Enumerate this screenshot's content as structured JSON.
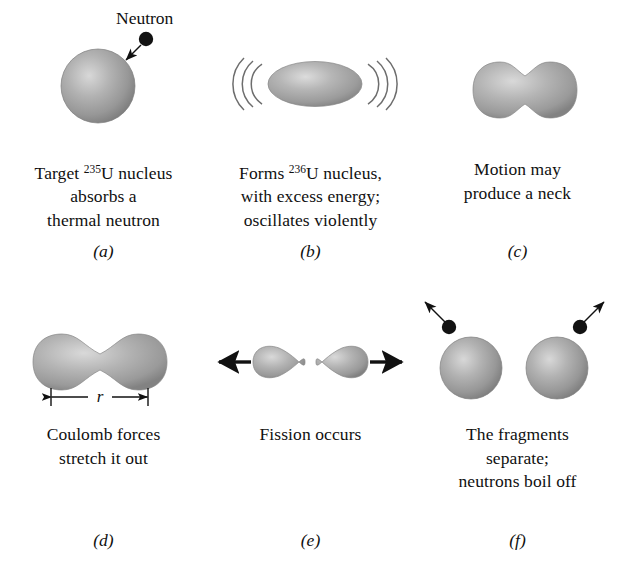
{
  "figure": {
    "colors": {
      "nucleus_fill": "#9a9a9a",
      "nucleus_highlight": "#cfcfcf",
      "nucleus_edge": "#6f6f6f",
      "ink": "#101010",
      "background": "#ffffff"
    },
    "panels": [
      {
        "id": "a",
        "tag": "(a)",
        "annotation": "Neutron",
        "caption_lines": [
          {
            "pre": "Target ",
            "sup": "235",
            "post": "U nucleus"
          },
          {
            "pre": "absorbs a",
            "sup": "",
            "post": ""
          },
          {
            "pre": "thermal neutron",
            "sup": "",
            "post": ""
          }
        ]
      },
      {
        "id": "b",
        "tag": "(b)",
        "annotation": "",
        "caption_lines": [
          {
            "pre": "Forms ",
            "sup": "236",
            "post": "U nucleus,"
          },
          {
            "pre": "with excess energy;",
            "sup": "",
            "post": ""
          },
          {
            "pre": "oscillates violently",
            "sup": "",
            "post": ""
          }
        ]
      },
      {
        "id": "c",
        "tag": "(c)",
        "annotation": "",
        "caption_lines": [
          {
            "pre": "Motion may",
            "sup": "",
            "post": ""
          },
          {
            "pre": "produce a neck",
            "sup": "",
            "post": ""
          }
        ]
      },
      {
        "id": "d",
        "tag": "(d)",
        "annotation": "r",
        "caption_lines": [
          {
            "pre": "Coulomb forces",
            "sup": "",
            "post": ""
          },
          {
            "pre": "stretch it out",
            "sup": "",
            "post": ""
          }
        ]
      },
      {
        "id": "e",
        "tag": "(e)",
        "annotation": "",
        "caption_lines": [
          {
            "pre": "Fission occurs",
            "sup": "",
            "post": ""
          }
        ]
      },
      {
        "id": "f",
        "tag": "(f)",
        "annotation": "",
        "caption_lines": [
          {
            "pre": "The fragments",
            "sup": "",
            "post": ""
          },
          {
            "pre": "separate;",
            "sup": "",
            "post": ""
          },
          {
            "pre": "neutrons boil off",
            "sup": "",
            "post": ""
          }
        ]
      }
    ]
  }
}
